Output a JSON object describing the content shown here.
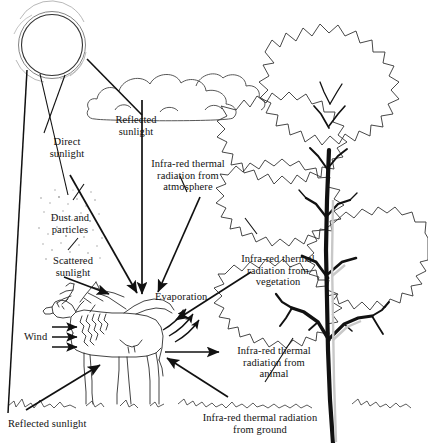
{
  "figure": {
    "type": "diagram",
    "background_color": "#ffffff",
    "ink_color": "#111111"
  },
  "labels": [
    {
      "id": "direct-sunlight",
      "text": "Direct\nsunlight",
      "x": 60,
      "y": 136,
      "align": "center"
    },
    {
      "id": "reflected-sunlight-cloud",
      "text": "Reflected\nsunlight",
      "x": 107,
      "y": 114,
      "align": "center"
    },
    {
      "id": "infrared-atmosphere",
      "text": "Infra-red thermal\nradiation from\natmosphere",
      "x": 186,
      "y": 158,
      "align": "center"
    },
    {
      "id": "dust-and-particles",
      "text": "Dust and\nparticles",
      "x": 69,
      "y": 212,
      "align": "center"
    },
    {
      "id": "scattered-sunlight",
      "text": "Scattered\nsunlight",
      "x": 72,
      "y": 255,
      "align": "center"
    },
    {
      "id": "infrared-vegetation",
      "text": "Infra-red thermal\nradiation from\nvegetation",
      "x": 277,
      "y": 253,
      "align": "center"
    },
    {
      "id": "evaporation",
      "text": "Evaporation",
      "x": 188,
      "y": 296,
      "align": "left"
    },
    {
      "id": "wind",
      "text": "Wind",
      "x": 28,
      "y": 337,
      "align": "left"
    },
    {
      "id": "infrared-animal",
      "text": "Infra-red thermal\nradiation from\nanimal",
      "x": 274,
      "y": 347,
      "align": "center"
    },
    {
      "id": "reflected-sunlight-ground",
      "text": "Reflected sunlight",
      "x": 8,
      "y": 422,
      "align": "left"
    },
    {
      "id": "infrared-ground",
      "text": "Infra-red thermal radiation\nfrom ground",
      "x": 260,
      "y": 415,
      "align": "center"
    }
  ],
  "elements": {
    "sun": "sun-icon",
    "cloud": "cloud-icon",
    "tree": "tree-icon",
    "deer": "deer-icon",
    "ground": "ground-line",
    "dust_cloud": "dust-particles-icon"
  }
}
